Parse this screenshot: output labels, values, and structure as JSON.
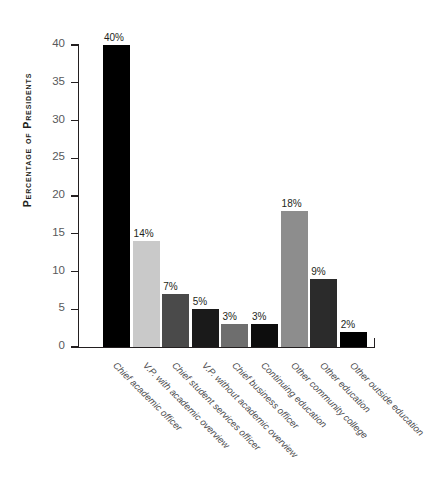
{
  "chart_data": {
    "type": "bar",
    "title": "",
    "xlabel": "",
    "ylabel": "Percentage of Presidents",
    "ylim": [
      0,
      40
    ],
    "grid": false,
    "legend": false,
    "categories": [
      "Chief academic officer",
      "V.P. with academic overview",
      "Chief student services officer",
      "V.P. without academic overview",
      "Chief business officer",
      "Continuing education",
      "Other community college",
      "Other education",
      "Other outside education"
    ],
    "values": [
      40,
      14,
      7,
      5,
      3,
      3,
      18,
      9,
      2
    ],
    "value_labels": [
      "40%",
      "14%",
      "7%",
      "5%",
      "3%",
      "3%",
      "18%",
      "9%",
      "2%"
    ],
    "bar_colors": [
      "#000000",
      "#c9c9c9",
      "#4a4a4a",
      "#1a1a1a",
      "#6e6e6e",
      "#0d0d0d",
      "#8d8d8d",
      "#2b2b2b",
      "#000000"
    ],
    "ytick_labels": [
      "0",
      "5",
      "10",
      "15",
      "20",
      "25",
      "30",
      "35",
      "40"
    ],
    "ytick_values": [
      0,
      5,
      10,
      15,
      20,
      25,
      30,
      35,
      40
    ]
  },
  "axis": {
    "y_title": "Percentage of Presidents"
  }
}
